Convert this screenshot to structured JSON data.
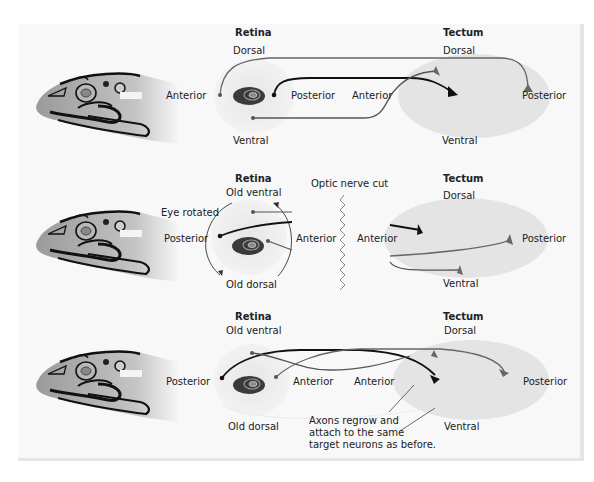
{
  "colors": {
    "background": "#ffffff",
    "panel": "#f8f8f8",
    "tectum_fill": "#e2e2e2",
    "retina_fill": "#ebebeb",
    "lens_dark": "#3a3a3a",
    "axon_black": "#111111",
    "axon_gray": "#6e6e6e",
    "text": "#222222"
  },
  "panels": [
    {
      "retina": {
        "title": "Retina",
        "top": "Dorsal",
        "bottom": "Ventral",
        "left": "Anterior",
        "right": "Posterior"
      },
      "tectum": {
        "title": "Tectum",
        "top": "Dorsal",
        "bottom": "Ventral",
        "left": "Anterior",
        "right": "Posterior"
      }
    },
    {
      "retina": {
        "title": "Retina",
        "top": "Old ventral",
        "bottom": "Old dorsal",
        "left": "Posterior",
        "right": "Anterior",
        "rotation_label": "Eye rotated"
      },
      "cut_label": "Optic nerve cut",
      "tectum": {
        "title": "Tectum",
        "top": "Dorsal",
        "bottom": "Ventral",
        "left": "Anterior",
        "right": "Posterior"
      }
    },
    {
      "retina": {
        "title": "Retina",
        "top": "Old ventral",
        "bottom": "Old dorsal",
        "left": "Posterior",
        "right": "Anterior"
      },
      "tectum": {
        "title": "Tectum",
        "top": "Dorsal",
        "bottom": "Ventral",
        "left": "Anterior",
        "right": "Posterior"
      },
      "annotation": [
        "Axons regrow and",
        "attach to the same",
        "target neurons as before."
      ]
    }
  ]
}
